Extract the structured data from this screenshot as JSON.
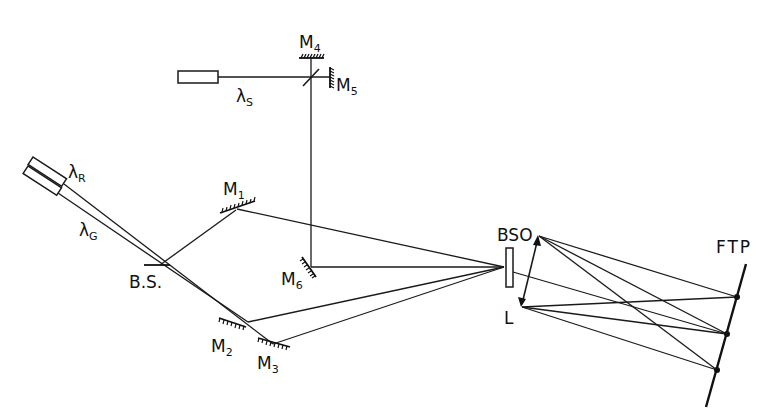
{
  "diagram": {
    "type": "optical-setup",
    "labels": {
      "lambda_s": {
        "main": "λ",
        "sub": "S"
      },
      "lambda_r": {
        "main": "λ",
        "sub": "R"
      },
      "lambda_g": {
        "main": "λ",
        "sub": "G"
      },
      "m1": {
        "main": "M",
        "sub": "1"
      },
      "m2": {
        "main": "M",
        "sub": "2"
      },
      "m3": {
        "main": "M",
        "sub": "3"
      },
      "m4": {
        "main": "M",
        "sub": "4"
      },
      "m5": {
        "main": "M",
        "sub": "5"
      },
      "m6": {
        "main": "M",
        "sub": "6"
      },
      "beam_splitter": "B.S.",
      "crystal": "BSO",
      "lens": "L",
      "plane": "FTP"
    },
    "components": [
      "laser-lambda-s",
      "laser-lambda-r",
      "laser-lambda-g",
      "mirror-m1",
      "mirror-m2",
      "mirror-m3",
      "mirror-m4",
      "mirror-m5",
      "mirror-m6",
      "beam-splitter",
      "beam-splitter-m4-m5",
      "bso-crystal",
      "lens-l",
      "fourier-transform-plane"
    ]
  }
}
